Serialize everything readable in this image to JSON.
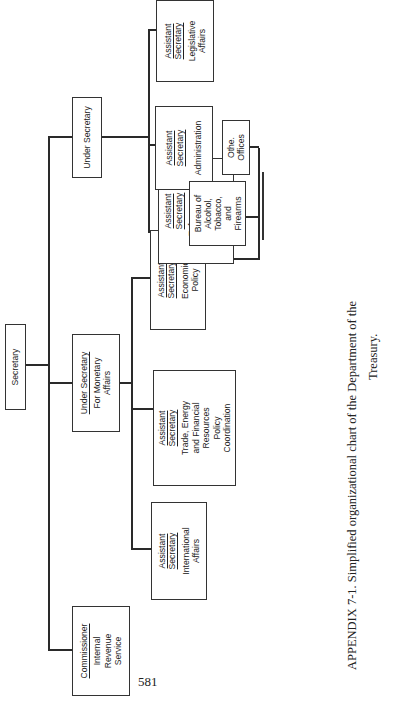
{
  "chart": {
    "type": "org-chart",
    "orientation": "rotated-90-ccw",
    "root": {
      "id": "secretary",
      "title": "Secretary"
    },
    "units": [
      {
        "id": "commissioner",
        "title": "Commissioner",
        "body": "Internal\nRevenue\nService",
        "parent": "secretary"
      },
      {
        "id": "under-secretary-monetary",
        "title": "Under Secretary",
        "body": "For Monetary\nAffairs",
        "parent": "secretary"
      },
      {
        "id": "under-secretary",
        "title": "Under Secretary",
        "body": "",
        "parent": "secretary"
      },
      {
        "id": "as-international",
        "title": "Assistant\nSecretary",
        "body": "International\nAffairs",
        "parent": "under-secretary-monetary"
      },
      {
        "id": "as-trade",
        "title": "Assistant\nSecretary",
        "body": "Trade, Energy\nand Financial\nResources\nPolicy\nCoordination",
        "parent": "under-secretary-monetary"
      },
      {
        "id": "as-economic",
        "title": "Assistant\nSecretary",
        "body": "Economic\nPolicy",
        "parent": "under-secretary-monetary"
      },
      {
        "id": "as-enforcement",
        "title": "Assistant\nSecretary",
        "body": "Enforcement,\nOperations,\nand Tariff\nAffairs",
        "parent": "under-secretary"
      },
      {
        "id": "as-administration",
        "title": "Assistant\nSecretary",
        "body": "Administration",
        "parent": "under-secretary"
      },
      {
        "id": "as-legislative",
        "title": "Assistant\nSecretary",
        "body": "Legislative\nAffairs",
        "parent": "under-secretary"
      },
      {
        "id": "batf",
        "title": "",
        "body": "Bureau of\nAlcohol,\nTobacco,\nand\nFirearms",
        "parent": "as-enforcement"
      },
      {
        "id": "other-offices",
        "title": "",
        "body": "Othe.\nOffices",
        "parent": "as-enforcement"
      }
    ]
  },
  "labels": {
    "secretary": "Secretary",
    "commissioner_title": "Commissioner",
    "commissioner_body": "Internal\nRevenue\nService",
    "usm_title": "Under Secretary",
    "usm_body": "For Monetary\nAffairs",
    "us_title": "Under Secretary",
    "as_title": "Assistant\nSecretary",
    "international": "International\nAffairs",
    "trade": "Trade, Energy\nand Financial\nResources\nPolicy\nCoordination",
    "economic": "Economic\nPolicy",
    "enforcement": "Enforcement,\nOperations,\nand Tariff\nAffairs",
    "administration": "Administration",
    "legislative": "Legislative\nAffairs",
    "batf": "Bureau of\nAlcohol,\nTobacco,\nand\nFirearms",
    "other": "Othe.\nOffices"
  },
  "caption": {
    "line1": "APPENDIX 7-1.   Simplified organizational chart of the Department of the",
    "line2": "Treasury."
  },
  "page_number": "581",
  "colors": {
    "line": "#2a2a2a",
    "box_border": "#333333",
    "text": "#222222",
    "background": "#ffffff"
  }
}
